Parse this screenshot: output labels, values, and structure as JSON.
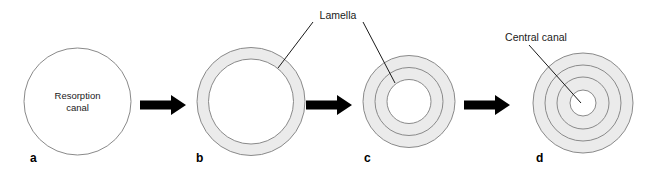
{
  "figure": {
    "background_color": "#ffffff",
    "lamella_fill_color": "#ebebeb",
    "outline_color": "#8a8a8a",
    "arrow_color": "#000000",
    "text_color": "#1a1a1a"
  },
  "panels": [
    {
      "letter": "a",
      "inner_label_line1": "Resorption",
      "inner_label_line2": "canal",
      "ring_count": 0,
      "description": "Open resorption canal, no lamellae"
    },
    {
      "letter": "b",
      "ring_count": 1,
      "description": "One lamella deposited around canal"
    },
    {
      "letter": "c",
      "ring_count": 2,
      "description": "Two concentric lamellae, narrowed canal"
    },
    {
      "letter": "d",
      "ring_count": 3,
      "description": "Three concentric lamellae around small central canal"
    }
  ],
  "callouts": [
    {
      "id": "lamella",
      "label": "Lamella",
      "points_to": [
        "panel-b",
        "panel-c"
      ]
    },
    {
      "id": "central-canal",
      "label": "Central canal",
      "points_to": [
        "panel-d"
      ]
    }
  ],
  "arrows": [
    {
      "id": "arrow-a-b",
      "from": "a",
      "to": "b"
    },
    {
      "id": "arrow-b-c",
      "from": "b",
      "to": "c"
    },
    {
      "id": "arrow-c-d",
      "from": "c",
      "to": "d"
    }
  ]
}
